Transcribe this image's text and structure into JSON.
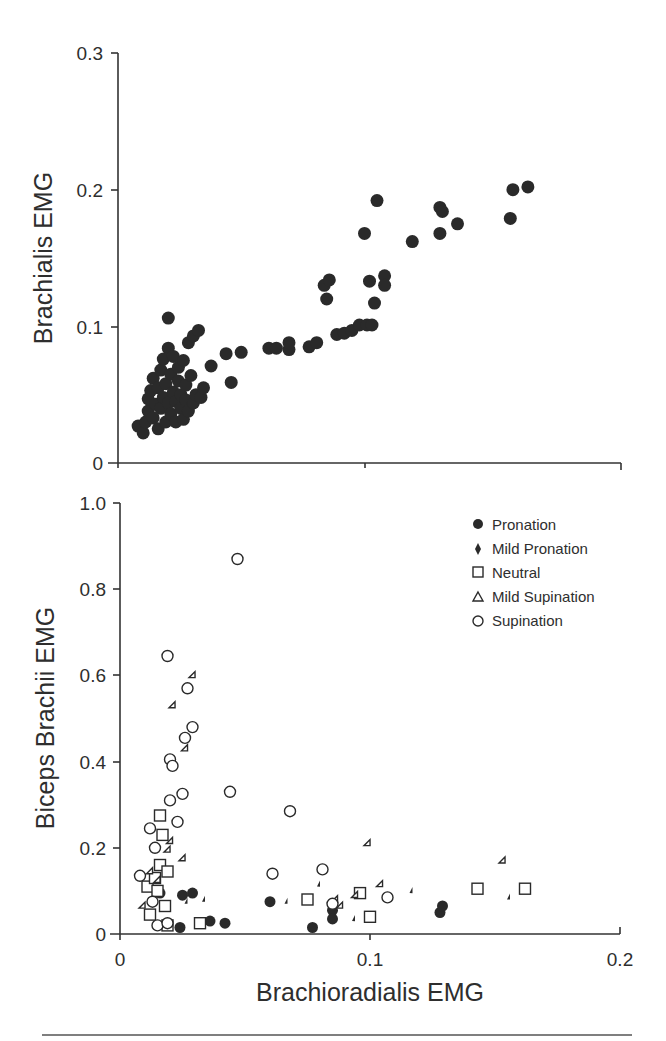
{
  "chart_data": [
    {
      "type": "scatter",
      "title": "",
      "xlabel": "",
      "ylabel": "Brachialis EMG",
      "xlim": [
        0,
        0.2
      ],
      "ylim": [
        0,
        0.3
      ],
      "yticks": [
        "0",
        "0.1",
        "0.2",
        "0.3"
      ],
      "xticks": [],
      "grid": false,
      "legend": null,
      "series": [
        {
          "name": "All conditions",
          "marker": "filled-circle",
          "points": [
            [
              0.008,
              0.027
            ],
            [
              0.01,
              0.022
            ],
            [
              0.011,
              0.03
            ],
            [
              0.012,
              0.038
            ],
            [
              0.012,
              0.047
            ],
            [
              0.013,
              0.053
            ],
            [
              0.014,
              0.062
            ],
            [
              0.014,
              0.033
            ],
            [
              0.015,
              0.043
            ],
            [
              0.016,
              0.025
            ],
            [
              0.016,
              0.055
            ],
            [
              0.017,
              0.068
            ],
            [
              0.017,
              0.04
            ],
            [
              0.018,
              0.048
            ],
            [
              0.018,
              0.076
            ],
            [
              0.019,
              0.058
            ],
            [
              0.019,
              0.03
            ],
            [
              0.02,
              0.084
            ],
            [
              0.02,
              0.106
            ],
            [
              0.02,
              0.044
            ],
            [
              0.021,
              0.065
            ],
            [
              0.021,
              0.036
            ],
            [
              0.022,
              0.052
            ],
            [
              0.022,
              0.078
            ],
            [
              0.023,
              0.045
            ],
            [
              0.023,
              0.03
            ],
            [
              0.024,
              0.06
            ],
            [
              0.024,
              0.07
            ],
            [
              0.025,
              0.04
            ],
            [
              0.025,
              0.05
            ],
            [
              0.026,
              0.075
            ],
            [
              0.026,
              0.032
            ],
            [
              0.027,
              0.057
            ],
            [
              0.027,
              0.046
            ],
            [
              0.028,
              0.088
            ],
            [
              0.028,
              0.038
            ],
            [
              0.029,
              0.064
            ],
            [
              0.03,
              0.044
            ],
            [
              0.03,
              0.093
            ],
            [
              0.031,
              0.05
            ],
            [
              0.032,
              0.097
            ],
            [
              0.033,
              0.048
            ],
            [
              0.034,
              0.055
            ],
            [
              0.037,
              0.071
            ],
            [
              0.043,
              0.08
            ],
            [
              0.045,
              0.059
            ],
            [
              0.049,
              0.081
            ],
            [
              0.06,
              0.084
            ],
            [
              0.063,
              0.084
            ],
            [
              0.068,
              0.083
            ],
            [
              0.068,
              0.088
            ],
            [
              0.076,
              0.085
            ],
            [
              0.079,
              0.088
            ],
            [
              0.082,
              0.13
            ],
            [
              0.083,
              0.12
            ],
            [
              0.084,
              0.134
            ],
            [
              0.087,
              0.094
            ],
            [
              0.09,
              0.095
            ],
            [
              0.093,
              0.097
            ],
            [
              0.096,
              0.101
            ],
            [
              0.099,
              0.101
            ],
            [
              0.098,
              0.168
            ],
            [
              0.1,
              0.133
            ],
            [
              0.101,
              0.101
            ],
            [
              0.102,
              0.117
            ],
            [
              0.103,
              0.192
            ],
            [
              0.106,
              0.137
            ],
            [
              0.106,
              0.13
            ],
            [
              0.117,
              0.162
            ],
            [
              0.128,
              0.187
            ],
            [
              0.129,
              0.184
            ],
            [
              0.128,
              0.168
            ],
            [
              0.135,
              0.175
            ],
            [
              0.156,
              0.179
            ],
            [
              0.157,
              0.2
            ],
            [
              0.163,
              0.202
            ]
          ]
        }
      ]
    },
    {
      "type": "scatter",
      "title": "",
      "xlabel": "Brachioradialis EMG",
      "ylabel": "Biceps Brachii EMG",
      "xlim": [
        0,
        0.2
      ],
      "ylim": [
        0,
        1.0
      ],
      "xticks": [
        "0",
        "0.1",
        "0.2"
      ],
      "yticks": [
        "0",
        "0.2",
        "0.4",
        "0.6",
        "0.8",
        "1.0"
      ],
      "grid": false,
      "legend": {
        "position": "upper right",
        "entries": [
          "Pronation",
          "Mild Pronation",
          "Neutral",
          "Mild Supination",
          "Supination"
        ]
      },
      "series": [
        {
          "name": "Pronation",
          "marker": "filled-circle",
          "points": [
            [
              0.016,
              0.095
            ],
            [
              0.024,
              0.015
            ],
            [
              0.025,
              0.09
            ],
            [
              0.029,
              0.095
            ],
            [
              0.036,
              0.03
            ],
            [
              0.042,
              0.025
            ],
            [
              0.06,
              0.075
            ],
            [
              0.077,
              0.015
            ],
            [
              0.085,
              0.055
            ],
            [
              0.085,
              0.035
            ],
            [
              0.128,
              0.05
            ],
            [
              0.129,
              0.065
            ]
          ]
        },
        {
          "name": "Mild Pronation",
          "marker": "filled-diamond",
          "points": [
            [
              0.027,
              0.07
            ],
            [
              0.034,
              0.075
            ],
            [
              0.067,
              0.07
            ],
            [
              0.08,
              0.11
            ],
            [
              0.094,
              0.03
            ],
            [
              0.117,
              0.095
            ],
            [
              0.156,
              0.08
            ]
          ]
        },
        {
          "name": "Neutral",
          "marker": "open-square",
          "points": [
            [
              0.011,
              0.11
            ],
            [
              0.012,
              0.045
            ],
            [
              0.014,
              0.13
            ],
            [
              0.015,
              0.1
            ],
            [
              0.016,
              0.16
            ],
            [
              0.016,
              0.275
            ],
            [
              0.017,
              0.23
            ],
            [
              0.018,
              0.065
            ],
            [
              0.019,
              0.145
            ],
            [
              0.019,
              0.02
            ],
            [
              0.032,
              0.025
            ],
            [
              0.075,
              0.08
            ],
            [
              0.096,
              0.095
            ],
            [
              0.1,
              0.04
            ],
            [
              0.143,
              0.105
            ],
            [
              0.162,
              0.105
            ]
          ]
        },
        {
          "name": "Mild Supination",
          "marker": "open-triangle",
          "points": [
            [
              0.01,
              0.06
            ],
            [
              0.013,
              0.14
            ],
            [
              0.016,
              0.12
            ],
            [
              0.02,
              0.19
            ],
            [
              0.021,
              0.21
            ],
            [
              0.022,
              0.525
            ],
            [
              0.026,
              0.17
            ],
            [
              0.027,
              0.425
            ],
            [
              0.03,
              0.595
            ],
            [
              0.087,
              0.075
            ],
            [
              0.089,
              0.06
            ],
            [
              0.095,
              0.085
            ],
            [
              0.1,
              0.205
            ],
            [
              0.105,
              0.11
            ],
            [
              0.154,
              0.165
            ]
          ]
        },
        {
          "name": "Supination",
          "marker": "open-circle",
          "points": [
            [
              0.008,
              0.135
            ],
            [
              0.012,
              0.245
            ],
            [
              0.013,
              0.075
            ],
            [
              0.014,
              0.2
            ],
            [
              0.015,
              0.02
            ],
            [
              0.019,
              0.645
            ],
            [
              0.019,
              0.025
            ],
            [
              0.02,
              0.405
            ],
            [
              0.021,
              0.39
            ],
            [
              0.02,
              0.31
            ],
            [
              0.023,
              0.26
            ],
            [
              0.025,
              0.325
            ],
            [
              0.026,
              0.455
            ],
            [
              0.027,
              0.57
            ],
            [
              0.029,
              0.48
            ],
            [
              0.044,
              0.33
            ],
            [
              0.047,
              0.87
            ],
            [
              0.061,
              0.14
            ],
            [
              0.068,
              0.285
            ],
            [
              0.081,
              0.15
            ],
            [
              0.085,
              0.07
            ],
            [
              0.107,
              0.085
            ]
          ]
        }
      ]
    }
  ],
  "figure": {
    "top_ylabel": "Brachialis EMG",
    "bottom_ylabel": "Biceps Brachii EMG",
    "xlabel": "Brachioradialis EMG",
    "top_yticks": [
      "0",
      "0.1",
      "0.2",
      "0.3"
    ],
    "bottom_yticks": [
      "0",
      "0.2",
      "0.4",
      "0.6",
      "0.8",
      "1.0"
    ],
    "bottom_xticks": [
      "0",
      "0.1",
      "0.2"
    ],
    "legend": [
      {
        "label": "Pronation",
        "marker": "filled-circle"
      },
      {
        "label": "Mild Pronation",
        "marker": "filled-diamond"
      },
      {
        "label": "Neutral",
        "marker": "open-square"
      },
      {
        "label": "Mild Supination",
        "marker": "open-triangle"
      },
      {
        "label": "Supination",
        "marker": "open-circle"
      }
    ],
    "marker_color": "#2a2a2a"
  }
}
